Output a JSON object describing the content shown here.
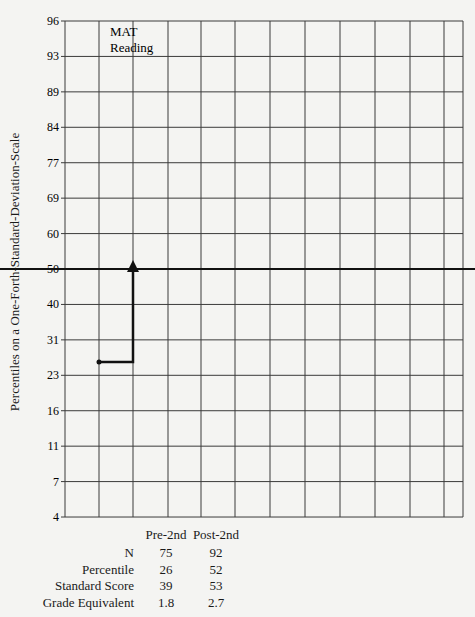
{
  "chart_data": {
    "type": "line",
    "title": "MAT Reading",
    "title_lines": [
      "MAT",
      "Reading"
    ],
    "ylabel": "Percentiles on a One-Forth-Standard-Deviation-Scale",
    "xlabel": "",
    "y_ticks": [
      96,
      93,
      89,
      84,
      77,
      69,
      60,
      50,
      40,
      31,
      23,
      16,
      11,
      7,
      4
    ],
    "ylim": [
      4,
      96
    ],
    "grid": true,
    "reference_line": {
      "y": 50,
      "style": "bold"
    },
    "series": [
      {
        "name": "MAT Reading gain",
        "points": [
          {
            "label": "Pre-2nd",
            "percentile": 26
          },
          {
            "label": "Post-2nd",
            "percentile": 52
          }
        ],
        "style": "step-arrow"
      }
    ],
    "table": {
      "columns": [
        "Pre-2nd",
        "Post-2nd"
      ],
      "rows": [
        {
          "label": "N",
          "values": [
            "75",
            "92"
          ]
        },
        {
          "label": "Percentile",
          "values": [
            "26",
            "52"
          ]
        },
        {
          "label": "Standard Score",
          "values": [
            "39",
            "53"
          ]
        },
        {
          "label": "Grade Equivalent",
          "values": [
            "1.8",
            "2.7"
          ]
        }
      ]
    }
  },
  "colors": {
    "background": "#f4f4f2",
    "grid": "#3a3a3a",
    "line": "#111111"
  }
}
